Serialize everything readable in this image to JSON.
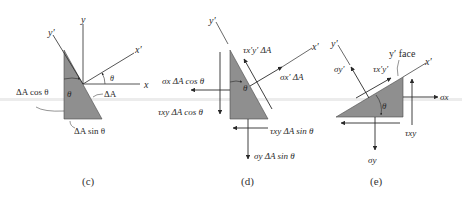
{
  "figure": {
    "panels": [
      {
        "id": "c",
        "caption": "(c)",
        "labels": {
          "y_axis": "y",
          "x_axis": "x",
          "y_prime": "y′",
          "x_prime": "x′",
          "theta_angle": "θ",
          "theta_inside": "θ",
          "area_incline": "ΔA",
          "area_vertical": "ΔA cos θ",
          "area_bottom": "ΔA sin θ"
        }
      },
      {
        "id": "d",
        "caption": "(d)",
        "labels": {
          "y_prime": "y′",
          "x_prime": "x′",
          "theta_inside": "θ",
          "shear_incline": "τx′y′ ΔA",
          "normal_incline": "σx′ ΔA",
          "normal_x": "σx ΔA cos θ",
          "shear_xy_vertical": "τxy ΔA cos θ",
          "shear_xy_bottom": "τxy ΔA sin θ",
          "normal_y": "σy ΔA sin θ"
        }
      },
      {
        "id": "e",
        "caption": "(e)",
        "labels": {
          "y_prime": "y′",
          "x_prime": "x′",
          "face_label": "y′ face",
          "sigma_y_prime": "σy′",
          "tau_x_prime_y_prime": "τx′y′",
          "theta": "θ",
          "sigma_x": "σx",
          "tau_xy": "τxy",
          "sigma_y": "σy"
        }
      }
    ],
    "colors": {
      "fill": "#8f8f8f",
      "line": "#2a2a2a",
      "text": "#2a2a2a"
    }
  }
}
